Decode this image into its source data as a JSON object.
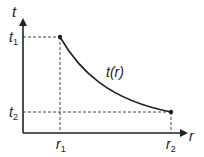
{
  "diagram": {
    "axis_y_label": "t",
    "axis_x_label": "r",
    "curve_label": "t(r)",
    "y_ticks": [
      {
        "main": "t",
        "sub": "1"
      },
      {
        "main": "t",
        "sub": "2"
      }
    ],
    "x_ticks": [
      {
        "main": "r",
        "sub": "1"
      },
      {
        "main": "r",
        "sub": "2"
      }
    ],
    "points": [
      {
        "name": "(r1, t1)",
        "x": 60,
        "y": 37
      },
      {
        "name": "(r2, t2)",
        "x": 171,
        "y": 112
      }
    ],
    "colors": {
      "line": "#222222",
      "dashed": "#444444",
      "background": "#ffffff"
    }
  }
}
